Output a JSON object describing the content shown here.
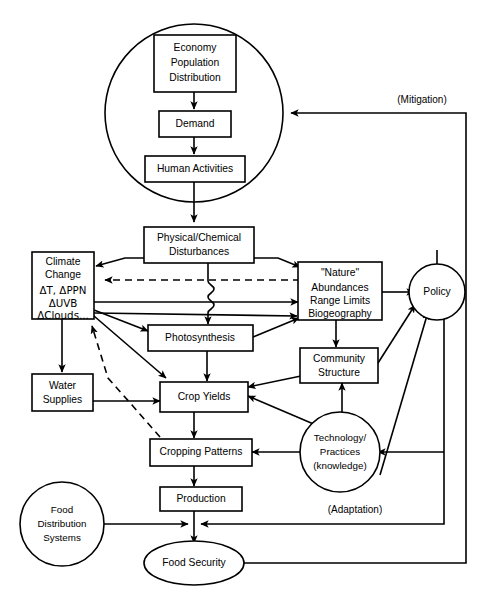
{
  "diagram": {
    "type": "flow-diagram",
    "background_color": "#ffffff",
    "line_color": "#000000",
    "width": 484,
    "height": 595
  },
  "nodes": {
    "economy": {
      "id": "economy",
      "shape": "rect",
      "lines": [
        "Economy",
        "Population",
        "Distribution"
      ],
      "line1": "Economy",
      "line2": "Population",
      "line3": "Distribution"
    },
    "demand": {
      "id": "demand",
      "shape": "rect",
      "label": "Demand"
    },
    "human_activities": {
      "id": "human_activities",
      "shape": "rect",
      "label": "Human Activities"
    },
    "physical_chemical": {
      "id": "physical_chemical",
      "shape": "rect",
      "line1": "Physical/Chemical",
      "line2": "Disturbances"
    },
    "climate_change": {
      "id": "climate_change",
      "shape": "rect",
      "line1": "Climate",
      "line2": "Change",
      "line3": "ΔT, ΔPPN",
      "line4": "ΔUVB",
      "line5": "ΔClouds..."
    },
    "nature": {
      "id": "nature",
      "shape": "rect",
      "line1": "\"Nature\"",
      "line2": "Abundances",
      "line3": "Range Limits",
      "line4": "Biogeography"
    },
    "photosynthesis": {
      "id": "photosynthesis",
      "shape": "rect",
      "label": "Photosynthesis"
    },
    "community_structure": {
      "id": "community_structure",
      "shape": "rect",
      "line1": "Community",
      "line2": "Structure"
    },
    "water_supplies": {
      "id": "water_supplies",
      "shape": "rect",
      "line1": "Water",
      "line2": "Supplies"
    },
    "crop_yields": {
      "id": "crop_yields",
      "shape": "rect",
      "label": "Crop Yields"
    },
    "cropping_patterns": {
      "id": "cropping_patterns",
      "shape": "rect",
      "label": "Cropping Patterns"
    },
    "production": {
      "id": "production",
      "shape": "rect",
      "label": "Production"
    },
    "technology": {
      "id": "technology",
      "shape": "circle",
      "line1": "Technology/",
      "line2": "Practices",
      "line3": "(knowledge)"
    },
    "policy": {
      "id": "policy",
      "shape": "circle",
      "label": "Policy"
    },
    "food_distribution": {
      "id": "food_distribution",
      "shape": "circle",
      "line1": "Food",
      "line2": "Distribution",
      "line3": "Systems"
    },
    "food_security": {
      "id": "food_security",
      "shape": "ellipse",
      "label": "Food Security"
    }
  },
  "annotations": {
    "mitigation": "(Mitigation)",
    "adaptation": "(Adaptation)"
  },
  "edges": [
    {
      "from": "economy",
      "to": "demand",
      "style": "solid"
    },
    {
      "from": "demand",
      "to": "human_activities",
      "style": "solid"
    },
    {
      "from": "human_activities",
      "to": "physical_chemical",
      "style": "solid"
    },
    {
      "from": "physical_chemical",
      "to": "climate_change",
      "style": "solid"
    },
    {
      "from": "physical_chemical",
      "to": "nature",
      "style": "solid"
    },
    {
      "from": "physical_chemical",
      "to": "photosynthesis",
      "style": "solid"
    },
    {
      "from": "climate_change",
      "to": "photosynthesis",
      "style": "solid"
    },
    {
      "from": "climate_change",
      "to": "nature",
      "style": "solid"
    },
    {
      "from": "climate_change",
      "to": "crop_yields",
      "style": "solid"
    },
    {
      "from": "climate_change",
      "to": "water_supplies",
      "style": "solid"
    },
    {
      "from": "nature",
      "to": "climate_change",
      "style": "dashed"
    },
    {
      "from": "nature",
      "to": "community_structure",
      "style": "solid"
    },
    {
      "from": "nature",
      "to": "policy",
      "style": "solid"
    },
    {
      "from": "photosynthesis",
      "to": "crop_yields",
      "style": "solid"
    },
    {
      "from": "photosynthesis",
      "to": "nature",
      "style": "solid"
    },
    {
      "from": "community_structure",
      "to": "crop_yields",
      "style": "solid"
    },
    {
      "from": "community_structure",
      "to": "policy",
      "style": "solid"
    },
    {
      "from": "water_supplies",
      "to": "crop_yields",
      "style": "solid"
    },
    {
      "from": "crop_yields",
      "to": "cropping_patterns",
      "style": "solid"
    },
    {
      "from": "cropping_patterns",
      "to": "climate_change",
      "style": "dashed"
    },
    {
      "from": "cropping_patterns",
      "to": "production",
      "style": "solid"
    },
    {
      "from": "technology",
      "to": "crop_yields",
      "style": "solid"
    },
    {
      "from": "technology",
      "to": "cropping_patterns",
      "style": "solid"
    },
    {
      "from": "technology",
      "to": "community_structure",
      "style": "solid"
    },
    {
      "from": "technology",
      "to": "policy",
      "style": "solid"
    },
    {
      "from": "production",
      "to": "food_security",
      "style": "solid"
    },
    {
      "from": "food_distribution",
      "to": "food_security",
      "style": "solid"
    },
    {
      "from": "food_security",
      "to": "policy",
      "style": "solid",
      "label": "(Mitigation)"
    },
    {
      "from": "policy",
      "to": "human_activities_circle",
      "style": "solid",
      "label": "(Mitigation)"
    },
    {
      "from": "policy",
      "to": "technology",
      "style": "solid",
      "label": "(Adaptation)"
    },
    {
      "from": "policy",
      "to": "food_security_junction",
      "style": "solid",
      "label": "(Adaptation)"
    }
  ]
}
